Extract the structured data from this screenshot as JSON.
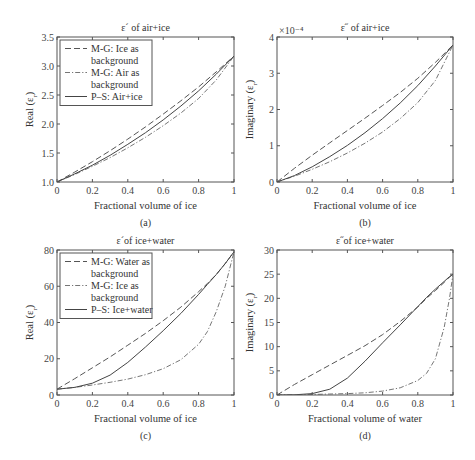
{
  "chart_data": [
    {
      "panel": "(a)",
      "type": "line",
      "title": "ε´ of air+ice",
      "xlabel": "Fractional volume of ice",
      "ylabel": "Real (ε_r)",
      "xlim": [
        0,
        1
      ],
      "ylim": [
        1.0,
        3.5
      ],
      "xticks": [
        0,
        0.2,
        0.4,
        0.6,
        0.8,
        1
      ],
      "xtick_labels": [
        "0",
        "0.2",
        "0.4",
        "0.6",
        "0.8",
        "1"
      ],
      "yticks": [
        1.0,
        1.5,
        2.0,
        2.5,
        3.0,
        3.5
      ],
      "ytick_labels": [
        "1.0",
        "1.5",
        "2.0",
        "2.5",
        "3.0",
        "3.5"
      ],
      "grid": false,
      "legend_position": "upper left",
      "x": [
        0,
        0.1,
        0.2,
        0.3,
        0.4,
        0.5,
        0.6,
        0.7,
        0.8,
        0.9,
        1.0
      ],
      "series": [
        {
          "name": "M-G: Ice as background",
          "style": "dash",
          "legend": [
            "M-G: Ice as",
            "background"
          ],
          "values": [
            1.0,
            1.17,
            1.35,
            1.54,
            1.74,
            1.95,
            2.17,
            2.4,
            2.64,
            2.9,
            3.17
          ]
        },
        {
          "name": "M-G: Air as background",
          "style": "dashdot",
          "legend": [
            "M-G: Air as",
            "background"
          ],
          "values": [
            1.0,
            1.13,
            1.27,
            1.42,
            1.59,
            1.77,
            1.97,
            2.19,
            2.44,
            2.76,
            3.17
          ]
        },
        {
          "name": "P–S: Air+ice",
          "style": "solid",
          "legend": [
            "P–S: Air+ice"
          ],
          "values": [
            1.0,
            1.14,
            1.29,
            1.46,
            1.65,
            1.85,
            2.07,
            2.31,
            2.57,
            2.86,
            3.17
          ]
        }
      ]
    },
    {
      "panel": "(b)",
      "type": "line",
      "title": "ε˝ of air+ice",
      "xlabel": "Fractional volume of ice",
      "ylabel": "Imaginary (ε_r)",
      "y_multiplier": "×10⁻⁴",
      "xlim": [
        0,
        1
      ],
      "ylim": [
        0,
        4
      ],
      "xticks": [
        0,
        0.2,
        0.4,
        0.6,
        0.8,
        1
      ],
      "xtick_labels": [
        "0",
        "0.2",
        "0.4",
        "0.6",
        "0.8",
        "1"
      ],
      "yticks": [
        0,
        1,
        2,
        3,
        4
      ],
      "ytick_labels": [
        "0",
        "1",
        "2",
        "3",
        "4"
      ],
      "grid": false,
      "x": [
        0,
        0.1,
        0.2,
        0.3,
        0.4,
        0.5,
        0.6,
        0.7,
        0.8,
        0.9,
        1.0
      ],
      "series": [
        {
          "name": "M-G: Ice as background",
          "style": "dash",
          "values": [
            0,
            0.38,
            0.74,
            1.08,
            1.42,
            1.76,
            2.11,
            2.47,
            2.86,
            3.3,
            3.78
          ]
        },
        {
          "name": "M-G: Air as background",
          "style": "dashdot",
          "values": [
            0,
            0.16,
            0.35,
            0.56,
            0.8,
            1.07,
            1.38,
            1.75,
            2.19,
            2.8,
            3.78
          ]
        },
        {
          "name": "P–S: Air+ice",
          "style": "solid",
          "values": [
            0,
            0.18,
            0.42,
            0.7,
            1.01,
            1.36,
            1.75,
            2.18,
            2.66,
            3.2,
            3.78
          ]
        }
      ]
    },
    {
      "panel": "(c)",
      "type": "line",
      "title": "ε´of ice+water",
      "xlabel": "Fractional volume of ice",
      "ylabel": "Real (ε_r)",
      "xlim": [
        0,
        1
      ],
      "ylim": [
        0,
        80
      ],
      "xticks": [
        0,
        0.2,
        0.4,
        0.6,
        0.8,
        1
      ],
      "xtick_labels": [
        "0",
        "0.2",
        "0.4",
        "0.6",
        "0.8",
        "1"
      ],
      "yticks": [
        0,
        20,
        40,
        60,
        80
      ],
      "ytick_labels": [
        "0",
        "20",
        "40",
        "60",
        "80"
      ],
      "grid": false,
      "legend_position": "upper left",
      "x": [
        0,
        0.1,
        0.2,
        0.3,
        0.4,
        0.5,
        0.6,
        0.7,
        0.8,
        0.85,
        0.9,
        0.95,
        1.0
      ],
      "series": [
        {
          "name": "M-G: Water as background",
          "style": "dash",
          "legend": [
            "M-G: Water as",
            "background"
          ],
          "values": [
            3.2,
            9.0,
            15.0,
            21.0,
            27.5,
            34.0,
            41.0,
            48.5,
            57.0,
            61.5,
            66.5,
            72.5,
            79.0
          ]
        },
        {
          "name": "M-G: Ice as background",
          "style": "dashdot",
          "legend": [
            "M-G: Ice as",
            "background"
          ],
          "values": [
            3.2,
            4.2,
            5.5,
            7.0,
            8.8,
            11.2,
            14.5,
            19.5,
            28.0,
            35.0,
            46.0,
            60.0,
            79.0
          ]
        },
        {
          "name": "P–S: Ice+water",
          "style": "solid",
          "legend": [
            "P–S: Ice+water"
          ],
          "values": [
            3.2,
            4.2,
            6.5,
            11.0,
            18.0,
            26.5,
            35.5,
            45.0,
            55.5,
            61.0,
            66.5,
            72.5,
            79.0
          ]
        }
      ]
    },
    {
      "panel": "(d)",
      "type": "line",
      "title": "ε˝of ice+water",
      "xlabel": "Fractional volume of water",
      "ylabel": "Imaginary (ε_r)",
      "xlim": [
        0,
        1
      ],
      "ylim": [
        0,
        30
      ],
      "xticks": [
        0,
        0.2,
        0.4,
        0.6,
        0.8,
        1
      ],
      "xtick_labels": [
        "0",
        "0.2",
        "0.4",
        "0.6",
        "0.8",
        "1"
      ],
      "yticks": [
        0,
        5,
        10,
        15,
        20,
        25,
        30
      ],
      "ytick_labels": [
        "0",
        "5",
        "10",
        "15",
        "20",
        "25",
        "30"
      ],
      "grid": false,
      "x": [
        0,
        0.1,
        0.2,
        0.3,
        0.4,
        0.5,
        0.6,
        0.7,
        0.8,
        0.85,
        0.9,
        0.95,
        0.98,
        1.0
      ],
      "series": [
        {
          "name": "M-G: Water as background",
          "style": "dash",
          "values": [
            0,
            2.2,
            4.2,
            6.2,
            8.2,
            10.2,
            12.5,
            15.2,
            18.2,
            20.0,
            21.6,
            23.3,
            24.4,
            25.0
          ]
        },
        {
          "name": "M-G: Ice as background",
          "style": "dashdot",
          "values": [
            0,
            0.05,
            0.1,
            0.2,
            0.3,
            0.45,
            0.8,
            1.5,
            3.0,
            4.5,
            7.5,
            14.0,
            20.0,
            25.0
          ]
        },
        {
          "name": "P–S: Ice+water",
          "style": "solid",
          "values": [
            0,
            0.05,
            0.3,
            1.2,
            3.5,
            7.0,
            10.8,
            14.5,
            18.3,
            20.2,
            21.9,
            23.5,
            24.5,
            25.0
          ]
        }
      ]
    }
  ],
  "panels": [
    {
      "rect": [
        57,
        37,
        234,
        182
      ]
    },
    {
      "rect": [
        277,
        37,
        453,
        182
      ]
    },
    {
      "rect": [
        57,
        250,
        234,
        395
      ]
    },
    {
      "rect": [
        277,
        250,
        453,
        395
      ]
    }
  ]
}
